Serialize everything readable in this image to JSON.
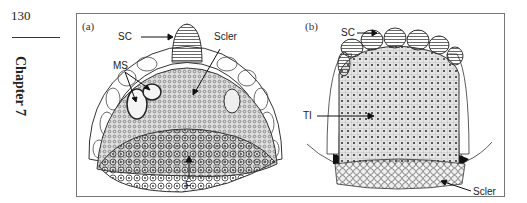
{
  "page": {
    "number": "130",
    "chapter": "Chapter 7"
  },
  "figure": {
    "panels": [
      {
        "id": "a",
        "label": "(a)",
        "annotations": [
          "SC",
          "Scler",
          "MS",
          "F"
        ]
      },
      {
        "id": "b",
        "label": "(b)",
        "annotations": [
          "SC",
          "TI",
          "Scler"
        ]
      }
    ]
  }
}
